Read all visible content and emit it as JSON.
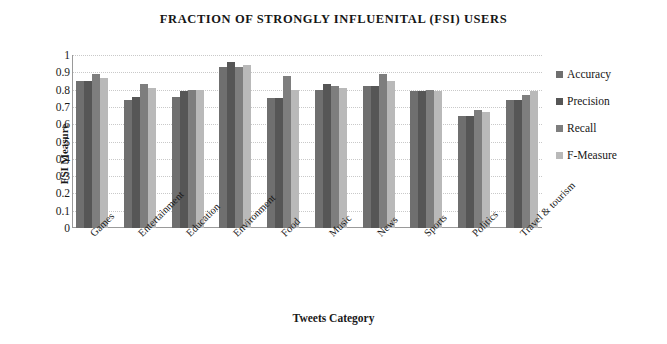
{
  "chart_data": {
    "type": "bar",
    "title": "FRACTION  OF  STRONGLY   INFLUENITAL   (FSI) USERS",
    "xlabel": "Tweets Category",
    "ylabel": "FSI Measure",
    "ylim": [
      0,
      1
    ],
    "ytick_labels": [
      "1",
      "0.9",
      "0.8",
      "0.7",
      "0.6",
      "0.5",
      "0.4",
      "0.3",
      "0.2",
      "0.1",
      "0"
    ],
    "ytick_values": [
      1,
      0.9,
      0.8,
      0.7,
      0.6,
      0.5,
      0.4,
      0.3,
      0.2,
      0.1,
      0
    ],
    "grid": true,
    "legend_position": "right",
    "categories": [
      "Games",
      "Entertainment",
      "Education",
      "Environment",
      "Food",
      "Music",
      "News",
      "Sports",
      "Politics",
      "Travel & tourism"
    ],
    "series": [
      {
        "name": "Accuracy",
        "color": "#6f6f6f",
        "values": [
          0.85,
          0.74,
          0.76,
          0.93,
          0.75,
          0.8,
          0.82,
          0.79,
          0.65,
          0.74
        ]
      },
      {
        "name": "Precision",
        "color": "#565656",
        "values": [
          0.85,
          0.76,
          0.79,
          0.96,
          0.75,
          0.83,
          0.82,
          0.79,
          0.65,
          0.74
        ]
      },
      {
        "name": "Recall",
        "color": "#7e7e7e",
        "values": [
          0.89,
          0.83,
          0.8,
          0.93,
          0.88,
          0.82,
          0.89,
          0.8,
          0.68,
          0.77
        ]
      },
      {
        "name": "F-Measure",
        "color": "#b9b9b9",
        "values": [
          0.87,
          0.81,
          0.8,
          0.94,
          0.8,
          0.81,
          0.85,
          0.79,
          0.67,
          0.79
        ]
      }
    ]
  }
}
